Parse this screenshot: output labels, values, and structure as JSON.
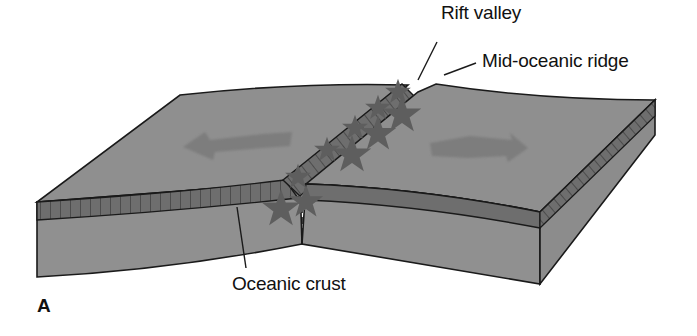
{
  "figure": {
    "panel_letter": "A",
    "labels": {
      "rift_valley": "Rift valley",
      "mid_oceanic_ridge": "Mid-oceanic ridge",
      "oceanic_crust": "Oceanic crust"
    },
    "arrows": [
      {
        "direction": "left",
        "meaning": "plate moving away from ridge"
      },
      {
        "direction": "right",
        "meaning": "plate moving away from ridge"
      }
    ],
    "earthquake_markers": "stars along rift",
    "colors": {
      "plate_surface": "#8f8f8f",
      "plate_side": "#909090",
      "crust_band": "#6e6e6e",
      "arrow": "#7a7a7a",
      "star": "#7f7f7f",
      "outline": "#1a1a1a",
      "background": "#ffffff"
    }
  }
}
